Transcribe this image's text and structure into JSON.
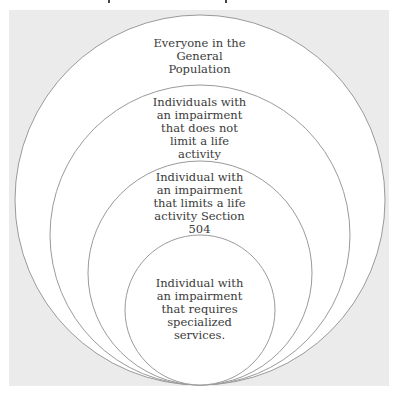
{
  "diagram": {
    "type": "nested-circles",
    "colors": {
      "background_panel": "#ebebeb",
      "circle_fill": "#ffffff",
      "circle_stroke": "#9a9a9a",
      "text": "#3a3a3a"
    },
    "circles": [
      {
        "label": "Everyone in the\nGeneral\nPopulation"
      },
      {
        "label": "Individuals with\nan impairment\nthat does not\nlimit a life\nactivity"
      },
      {
        "label": "Individual with\nan impairment\nthat limits a life\nactivity Section\n504"
      },
      {
        "label": "Individual with\nan impairment\nthat requires\nspecialized\nservices."
      }
    ]
  }
}
